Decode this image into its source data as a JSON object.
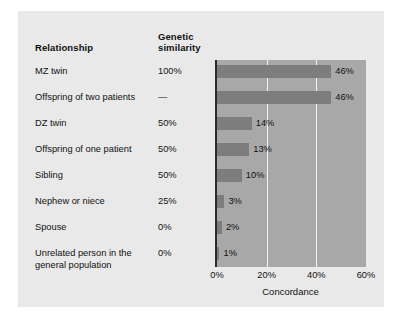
{
  "figure": {
    "background_color": "#e9e9e9",
    "plot_background_color": "#a8a8a8",
    "bar_color": "#7d7d7d",
    "gridline_color": "#f2f2f2",
    "axis_color": "#2a2a2a"
  },
  "headers": {
    "relationship": "Relationship",
    "genetic_similarity_line1": "Genetic",
    "genetic_similarity_line2": "similarity"
  },
  "chart_data": {
    "type": "bar",
    "orientation": "horizontal",
    "title": "",
    "xlabel": "Concordance",
    "ylabel": "",
    "xlim": [
      0,
      60
    ],
    "xticks": [
      0,
      20,
      40,
      60
    ],
    "xtick_labels": [
      "0%",
      "20%",
      "40%",
      "60%"
    ],
    "grid": true,
    "gridlines_at": [
      20,
      40
    ],
    "legend": "none",
    "categories": [
      "MZ twin",
      "Offspring of two patients",
      "DZ twin",
      "Offspring of one patient",
      "Sibling",
      "Nephew or niece",
      "Spouse",
      "Unrelated person in the general population"
    ],
    "values": [
      46,
      46,
      14,
      13,
      10,
      3,
      2,
      1
    ],
    "value_labels": [
      "46%",
      "46%",
      "14%",
      "13%",
      "10%",
      "3%",
      "2%",
      "1%"
    ],
    "genetic_similarity": [
      "100%",
      "—",
      "50%",
      "50%",
      "50%",
      "25%",
      "0%",
      "0%"
    ]
  },
  "rows": [
    {
      "label_line1": "MZ twin",
      "label_line2": "",
      "similarity": "100%",
      "value": 46,
      "value_label": "46%"
    },
    {
      "label_line1": "Offspring of two patients",
      "label_line2": "",
      "similarity": "—",
      "value": 46,
      "value_label": "46%"
    },
    {
      "label_line1": "DZ twin",
      "label_line2": "",
      "similarity": "50%",
      "value": 14,
      "value_label": "14%"
    },
    {
      "label_line1": "Offspring of one patient",
      "label_line2": "",
      "similarity": "50%",
      "value": 13,
      "value_label": "13%"
    },
    {
      "label_line1": "Sibling",
      "label_line2": "",
      "similarity": "50%",
      "value": 10,
      "value_label": "10%"
    },
    {
      "label_line1": "Nephew or niece",
      "label_line2": "",
      "similarity": "25%",
      "value": 3,
      "value_label": "3%"
    },
    {
      "label_line1": "Spouse",
      "label_line2": "",
      "similarity": "0%",
      "value": 2,
      "value_label": "2%"
    },
    {
      "label_line1": "Unrelated person in the",
      "label_line2": "general population",
      "similarity": "0%",
      "value": 1,
      "value_label": "1%"
    }
  ],
  "axis": {
    "ticks": [
      "0%",
      "20%",
      "40%",
      "60%"
    ],
    "label": "Concordance"
  }
}
